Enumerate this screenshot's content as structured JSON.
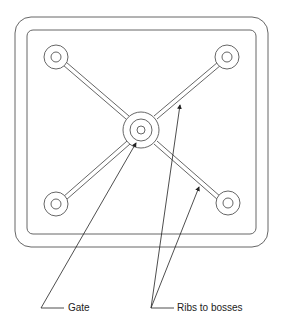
{
  "diagram": {
    "labels": {
      "gate": "Gate",
      "ribs": "Ribs to bosses"
    },
    "colors": {
      "stroke": "#555555",
      "text": "#222222",
      "background": "#ffffff"
    }
  }
}
